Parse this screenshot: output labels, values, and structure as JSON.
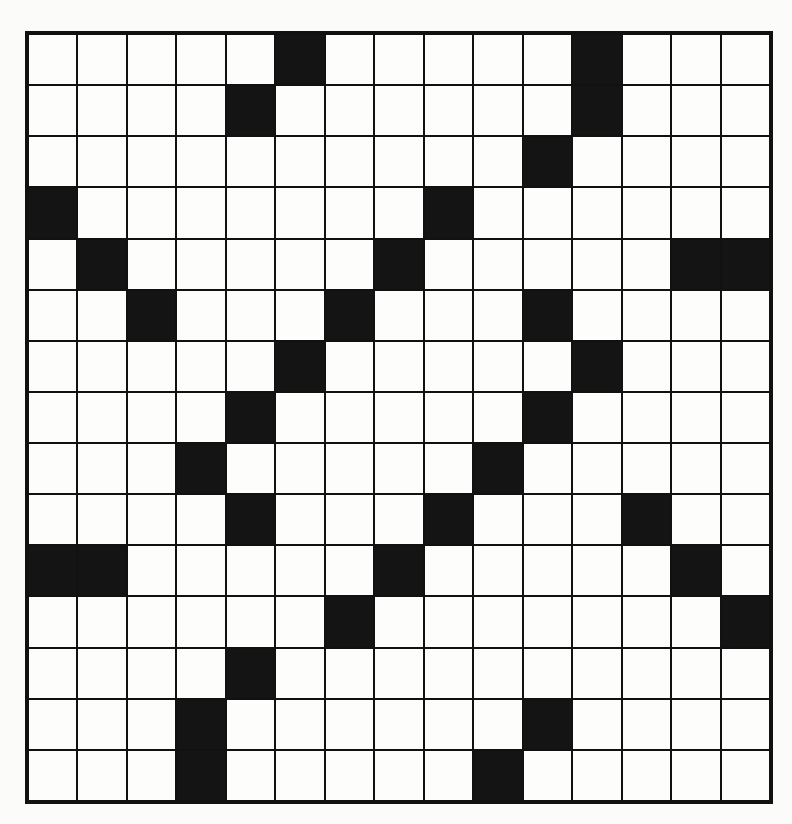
{
  "puzzle": {
    "type": "crossword-grid",
    "rows": 15,
    "cols": 15,
    "colors": {
      "block": "#141414",
      "empty": "#fdfdfb",
      "border": "#111111",
      "background": "#fbfbf9"
    },
    "black_cells": [
      [
        0,
        5
      ],
      [
        0,
        11
      ],
      [
        1,
        4
      ],
      [
        1,
        11
      ],
      [
        2,
        10
      ],
      [
        3,
        0
      ],
      [
        3,
        8
      ],
      [
        4,
        1
      ],
      [
        4,
        7
      ],
      [
        4,
        13
      ],
      [
        4,
        14
      ],
      [
        5,
        2
      ],
      [
        5,
        6
      ],
      [
        5,
        10
      ],
      [
        6,
        5
      ],
      [
        6,
        11
      ],
      [
        7,
        4
      ],
      [
        7,
        10
      ],
      [
        8,
        3
      ],
      [
        8,
        9
      ],
      [
        9,
        4
      ],
      [
        9,
        8
      ],
      [
        9,
        12
      ],
      [
        10,
        0
      ],
      [
        10,
        1
      ],
      [
        10,
        7
      ],
      [
        10,
        13
      ],
      [
        11,
        6
      ],
      [
        11,
        14
      ],
      [
        12,
        4
      ],
      [
        13,
        3
      ],
      [
        13,
        10
      ],
      [
        14,
        3
      ],
      [
        14,
        9
      ]
    ]
  }
}
